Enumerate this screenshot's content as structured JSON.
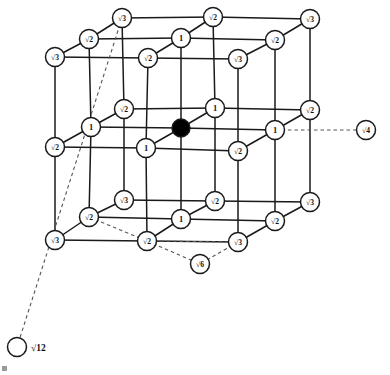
{
  "figure": {
    "type": "diagram",
    "colors": {
      "line": "#1a1a1a",
      "node_fill": "#ffffff",
      "node_stroke": "#1a1a1a",
      "center_fill": "#000000",
      "dashed": "#555555",
      "background": "#ffffff"
    },
    "node_radius": 9.5,
    "center_radius": 9.0,
    "external_radius": 9.5
  },
  "nodes": [
    {
      "id": "n0",
      "label": "√3",
      "x": 122,
      "y": 18,
      "kind": "open",
      "layer": "back-top"
    },
    {
      "id": "n1",
      "label": "√2",
      "x": 213,
      "y": 17,
      "kind": "open",
      "layer": "back-top"
    },
    {
      "id": "n2",
      "label": "√3",
      "x": 310,
      "y": 19,
      "kind": "open",
      "layer": "back-top"
    },
    {
      "id": "n3",
      "label": "√2",
      "x": 89,
      "y": 39,
      "kind": "open",
      "layer": "mid-top"
    },
    {
      "id": "n4",
      "label": "1",
      "x": 181,
      "y": 38,
      "kind": "open",
      "layer": "mid-top"
    },
    {
      "id": "n5",
      "label": "√2",
      "x": 275,
      "y": 40,
      "kind": "open",
      "layer": "mid-top"
    },
    {
      "id": "n6",
      "label": "√3",
      "x": 55,
      "y": 57,
      "kind": "open",
      "layer": "front-top"
    },
    {
      "id": "n7",
      "label": "√2",
      "x": 148,
      "y": 58,
      "kind": "open",
      "layer": "front-top"
    },
    {
      "id": "n8",
      "label": "√3",
      "x": 238,
      "y": 59,
      "kind": "open",
      "layer": "front-top"
    },
    {
      "id": "n9",
      "label": "√2",
      "x": 124,
      "y": 109,
      "kind": "open",
      "layer": "back-mid"
    },
    {
      "id": "n10",
      "label": "1",
      "x": 215,
      "y": 108,
      "kind": "open",
      "layer": "back-mid"
    },
    {
      "id": "n11",
      "label": "√2",
      "x": 310,
      "y": 110,
      "kind": "open",
      "layer": "back-mid"
    },
    {
      "id": "n12",
      "label": "1",
      "x": 91,
      "y": 127,
      "kind": "open",
      "layer": "mid-mid"
    },
    {
      "id": "n13",
      "label": "",
      "x": 181,
      "y": 128,
      "kind": "center",
      "layer": "mid-mid"
    },
    {
      "id": "n14",
      "label": "1",
      "x": 275,
      "y": 130,
      "kind": "open",
      "layer": "mid-mid"
    },
    {
      "id": "n15",
      "label": "√2",
      "x": 55,
      "y": 147,
      "kind": "open",
      "layer": "front-mid"
    },
    {
      "id": "n16",
      "label": "1",
      "x": 146,
      "y": 148,
      "kind": "open",
      "layer": "front-mid"
    },
    {
      "id": "n17",
      "label": "√2",
      "x": 238,
      "y": 151,
      "kind": "open",
      "layer": "front-mid"
    },
    {
      "id": "n18",
      "label": "√3",
      "x": 124,
      "y": 200,
      "kind": "open",
      "layer": "back-bot"
    },
    {
      "id": "n19",
      "label": "√2",
      "x": 215,
      "y": 201,
      "kind": "open",
      "layer": "back-bot"
    },
    {
      "id": "n20",
      "label": "√3",
      "x": 310,
      "y": 202,
      "kind": "open",
      "layer": "back-bot"
    },
    {
      "id": "n21",
      "label": "√2",
      "x": 89,
      "y": 217,
      "kind": "open",
      "layer": "mid-bot"
    },
    {
      "id": "n22",
      "label": "1",
      "x": 181,
      "y": 219,
      "kind": "open",
      "layer": "mid-bot"
    },
    {
      "id": "n23",
      "label": "√2",
      "x": 275,
      "y": 221,
      "kind": "open",
      "layer": "mid-bot"
    },
    {
      "id": "n24",
      "label": "√3",
      "x": 55,
      "y": 240,
      "kind": "open",
      "layer": "front-bot"
    },
    {
      "id": "n25",
      "label": "√2",
      "x": 147,
      "y": 241,
      "kind": "open",
      "layer": "front-bot"
    },
    {
      "id": "n26",
      "label": "√3",
      "x": 238,
      "y": 242,
      "kind": "open",
      "layer": "front-bot"
    }
  ],
  "external_nodes": [
    {
      "id": "e4",
      "label": "√4",
      "x": 366,
      "y": 130,
      "label_inside": true,
      "leader_from": {
        "x": 275,
        "y": 130
      },
      "name": "sqrt4-node"
    },
    {
      "id": "e12",
      "label": "√12",
      "x": 17,
      "y": 347,
      "label_inside": false,
      "label_x": 31,
      "label_y": 348,
      "leader_from": {
        "x": 122,
        "y": 18
      },
      "name": "sqrt12-node"
    },
    {
      "id": "e6",
      "label": "√6",
      "x": 200,
      "y": 264,
      "label_inside": true,
      "leader_from": {
        "x": 147,
        "y": 241
      },
      "name": "sqrt6-node"
    }
  ],
  "edges_solid": [
    [
      "n0",
      "n1"
    ],
    [
      "n1",
      "n2"
    ],
    [
      "n3",
      "n4"
    ],
    [
      "n4",
      "n5"
    ],
    [
      "n6",
      "n7"
    ],
    [
      "n7",
      "n8"
    ],
    [
      "n0",
      "n3"
    ],
    [
      "n3",
      "n6"
    ],
    [
      "n1",
      "n4"
    ],
    [
      "n4",
      "n7"
    ],
    [
      "n2",
      "n5"
    ],
    [
      "n5",
      "n8"
    ],
    [
      "n9",
      "n10"
    ],
    [
      "n10",
      "n11"
    ],
    [
      "n12",
      "n13"
    ],
    [
      "n13",
      "n14"
    ],
    [
      "n15",
      "n16"
    ],
    [
      "n16",
      "n17"
    ],
    [
      "n9",
      "n12"
    ],
    [
      "n12",
      "n15"
    ],
    [
      "n10",
      "n13"
    ],
    [
      "n13",
      "n16"
    ],
    [
      "n11",
      "n14"
    ],
    [
      "n14",
      "n17"
    ],
    [
      "n18",
      "n19"
    ],
    [
      "n19",
      "n20"
    ],
    [
      "n21",
      "n22"
    ],
    [
      "n22",
      "n23"
    ],
    [
      "n24",
      "n25"
    ],
    [
      "n25",
      "n26"
    ],
    [
      "n18",
      "n21"
    ],
    [
      "n21",
      "n24"
    ],
    [
      "n19",
      "n22"
    ],
    [
      "n22",
      "n25"
    ],
    [
      "n20",
      "n23"
    ],
    [
      "n23",
      "n26"
    ],
    [
      "n0",
      "n9"
    ],
    [
      "n9",
      "n18"
    ],
    [
      "n1",
      "n10"
    ],
    [
      "n10",
      "n19"
    ],
    [
      "n2",
      "n11"
    ],
    [
      "n11",
      "n20"
    ],
    [
      "n3",
      "n12"
    ],
    [
      "n12",
      "n21"
    ],
    [
      "n4",
      "n13"
    ],
    [
      "n13",
      "n22"
    ],
    [
      "n5",
      "n14"
    ],
    [
      "n14",
      "n23"
    ],
    [
      "n6",
      "n15"
    ],
    [
      "n15",
      "n24"
    ],
    [
      "n7",
      "n16"
    ],
    [
      "n16",
      "n25"
    ],
    [
      "n8",
      "n17"
    ],
    [
      "n17",
      "n26"
    ]
  ],
  "edges_dashed": [
    {
      "from": {
        "x": 122,
        "y": 18
      },
      "to": {
        "x": 17,
        "y": 347
      },
      "name": "leader-sqrt12"
    },
    {
      "from": {
        "x": 275,
        "y": 130
      },
      "to": {
        "x": 366,
        "y": 130
      },
      "name": "leader-sqrt4"
    },
    {
      "from": {
        "x": 147,
        "y": 241
      },
      "to": {
        "x": 200,
        "y": 264
      },
      "name": "leader-sqrt6-left"
    },
    {
      "from": {
        "x": 238,
        "y": 242
      },
      "to": {
        "x": 200,
        "y": 264
      },
      "name": "leader-sqrt6-right"
    },
    {
      "from": {
        "x": 89,
        "y": 217
      },
      "to": {
        "x": 147,
        "y": 241
      },
      "name": "dash-face-diagonal-a"
    },
    {
      "from": {
        "x": 147,
        "y": 241
      },
      "to": {
        "x": 238,
        "y": 242
      },
      "name": "dash-face-diagonal-b"
    }
  ],
  "legend": {
    "note": "Labels give the distance of each lattice site from the black central site in units of the lattice spacing a."
  }
}
